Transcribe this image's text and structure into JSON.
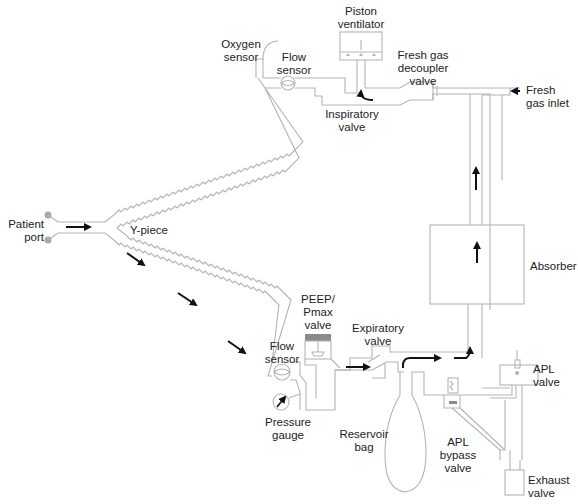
{
  "labels": {
    "piston_ventilator": "Piston\nventilator",
    "oxygen_sensor": "Oxygen\nsensor",
    "flow_sensor_top": "Flow\nsensor",
    "fresh_gas_decoupler": "Fresh gas\ndecoupler\nvalve",
    "fresh_gas_inlet": "Fresh\ngas inlet",
    "inspiratory_valve": "Inspiratory\nvalve",
    "patient_port": "Patient\nport",
    "y_piece": "Y-piece",
    "absorber": "Absorber",
    "peep_pmax_valve": "PEEP/\nPmax\nvalve",
    "expiratory_valve": "Expiratory\nvalve",
    "flow_sensor_bottom": "Flow\nsensor",
    "pressure_gauge": "Pressure\ngauge",
    "reservoir_bag": "Reservoir\nbag",
    "apl_valve": "APL\nvalve",
    "apl_bypass_valve": "APL\nbypass\nvalve",
    "exhaust_valve": "Exhaust\nvalve"
  },
  "colors": {
    "tube": "#b4b4b4",
    "arrow": "#111111",
    "peep_cap": "#8a8a8a",
    "port_dot": "#a8a8a8"
  }
}
